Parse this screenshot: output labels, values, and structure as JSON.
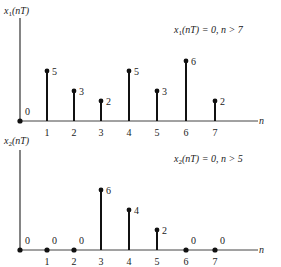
{
  "chart_data": [
    {
      "type": "stem",
      "ylabel": "x1(nT)",
      "xlabel": "n",
      "annotation": "x1(nT) = 0, n > 7",
      "x": [
        0,
        1,
        2,
        3,
        4,
        5,
        6,
        7
      ],
      "values": [
        0,
        5,
        3,
        2,
        5,
        3,
        6,
        2
      ],
      "tick_labels": [
        "1",
        "2",
        "3",
        "4",
        "5",
        "6",
        "7"
      ],
      "grid": false
    },
    {
      "type": "stem",
      "ylabel": "x2(nT)",
      "xlabel": "n",
      "annotation": "x2(nT) = 0, n > 5",
      "x": [
        0,
        1,
        2,
        3,
        4,
        5,
        6,
        7
      ],
      "values": [
        0,
        0,
        0,
        6,
        4,
        2,
        0,
        0
      ],
      "tick_labels": [
        "1",
        "2",
        "3",
        "4",
        "5",
        "6",
        "7"
      ],
      "grid": false
    }
  ],
  "layout": {
    "x_positions": [
      20,
      47,
      74,
      101,
      129,
      157,
      186,
      215
    ],
    "unit_px": 10,
    "panels": [
      {
        "baseline": 121,
        "axis_top": 18,
        "axis_end": 266,
        "label_y": 14,
        "annot_x": 174,
        "annot_y": 33
      },
      {
        "baseline": 250,
        "axis_top": 150,
        "axis_end": 266,
        "label_y": 144,
        "annot_x": 174,
        "annot_y": 162
      }
    ]
  }
}
